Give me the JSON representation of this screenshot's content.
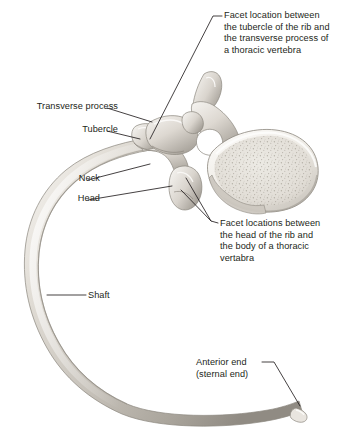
{
  "figure": {
    "background_color": "#ffffff",
    "text_color": "#231f20",
    "leader_line_color": "#231f20",
    "bone_colors": {
      "cortical_light": "#f2f0ec",
      "cortical_mid": "#cfcac3",
      "cortical_shadow": "#9e9991",
      "outline": "#8d887f",
      "trabecular_fill": "#e6e2db",
      "trabecular_speckle": "#a8a299",
      "foramen_dark": "#ffffff"
    }
  },
  "labels": {
    "facet_tubercle": "Facet location between\nthe tubercle of the rib and\nthe transverse process of\na thoracic vertebra",
    "facet_head": "Facet locations between\nthe head of the rib and\nthe body of a thoracic\nvertabra",
    "transverse_process": "Transverse process",
    "tubercle": "Tubercle",
    "neck": "Neck",
    "head": "Head",
    "shaft": "Shaft",
    "anterior_end": "Anterior end\n(sternal end)"
  },
  "structures": [
    {
      "name": "rib-shaft",
      "label_key": "shaft"
    },
    {
      "name": "rib-head",
      "label_key": "head"
    },
    {
      "name": "rib-neck",
      "label_key": "neck"
    },
    {
      "name": "rib-tubercle",
      "label_key": "tubercle"
    },
    {
      "name": "vertebra-transverse-process",
      "label_key": "transverse_process"
    },
    {
      "name": "rib-anterior-sternal-end",
      "label_key": "anterior_end"
    },
    {
      "name": "costotransverse-facet",
      "label_key": "facet_tubercle"
    },
    {
      "name": "costovertebral-facets",
      "label_key": "facet_head"
    }
  ]
}
